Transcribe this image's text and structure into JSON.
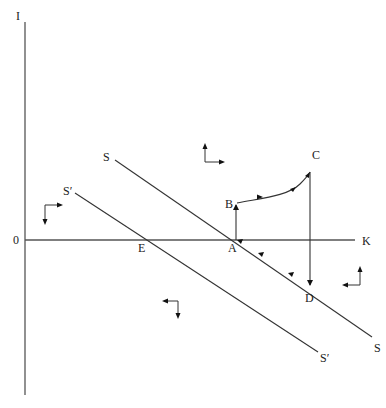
{
  "diagram": {
    "type": "phase-diagram",
    "axes": {
      "vertical_label": "I",
      "horizontal_label": "K",
      "origin_label": "0"
    },
    "curves": [
      {
        "id": "SS",
        "start_label": "S",
        "end_label": "S"
      },
      {
        "id": "S'S'",
        "start_label": "S′",
        "end_label": "S′"
      }
    ],
    "points": {
      "A": "A",
      "B": "B",
      "C": "C",
      "D": "D",
      "E": "E"
    },
    "path": {
      "sequence": [
        "A",
        "B",
        "C",
        "D",
        "A"
      ],
      "segments": [
        {
          "from": "A",
          "to": "B",
          "kind": "vertical-up"
        },
        {
          "from": "B",
          "to": "C",
          "kind": "curve-up-right"
        },
        {
          "from": "C",
          "to": "D",
          "kind": "vertical-down"
        },
        {
          "from": "D",
          "to": "A",
          "kind": "along-SS-up-left"
        }
      ]
    },
    "direction_icons": [
      {
        "region": "above-SS",
        "arrows": [
          "up",
          "right"
        ]
      },
      {
        "region": "left-above-S'S'",
        "arrows": [
          "right",
          "down"
        ]
      },
      {
        "region": "right-below-SS",
        "arrows": [
          "up",
          "left"
        ]
      },
      {
        "region": "below-S'S'",
        "arrows": [
          "left",
          "down"
        ]
      }
    ]
  }
}
